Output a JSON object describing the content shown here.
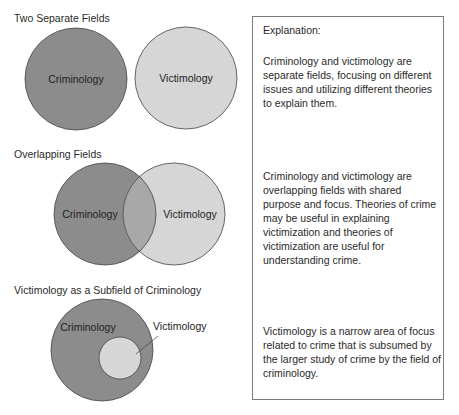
{
  "colors": {
    "criminology_fill": "#8c8c8c",
    "victimology_fill": "#d6d6d6",
    "overlap_fill": "#a8a8a8",
    "outline": "#454545",
    "box_border": "#7a7a7a"
  },
  "panels": [
    {
      "title": "Two Separate Fields",
      "circles": [
        {
          "label": "Criminology",
          "cx": 76,
          "cy": 79,
          "r": 51
        },
        {
          "label": "Victimology",
          "cx": 186,
          "cy": 78,
          "r": 51
        }
      ],
      "explanation": "Criminology and victimology are separate fields, focusing on different issues and utilizing different theories to explain them."
    },
    {
      "title": "Overlapping Fields",
      "circles": [
        {
          "label": "Criminology",
          "cx": 105,
          "cy": 214,
          "r": 51
        },
        {
          "label": "Victimology",
          "cx": 174,
          "cy": 214,
          "r": 51
        }
      ],
      "explanation": "Criminology and victimology are overlapping fields with shared purpose and focus. Theories of crime may be useful in explaining victimization and theories of victimization are useful for understanding crime."
    },
    {
      "title": "Victimology as a Subfield of Criminology",
      "circles": [
        {
          "label": "Criminology",
          "cx": 102,
          "cy": 350,
          "r": 51
        },
        {
          "label": "Victimology",
          "cx": 120,
          "cy": 358,
          "r": 21
        }
      ],
      "explanation": "Victimology is a narrow area of focus related to crime that is subsumed by the larger study of crime by the field of criminology."
    }
  ],
  "explanation_box": {
    "heading": "Explanation:"
  }
}
